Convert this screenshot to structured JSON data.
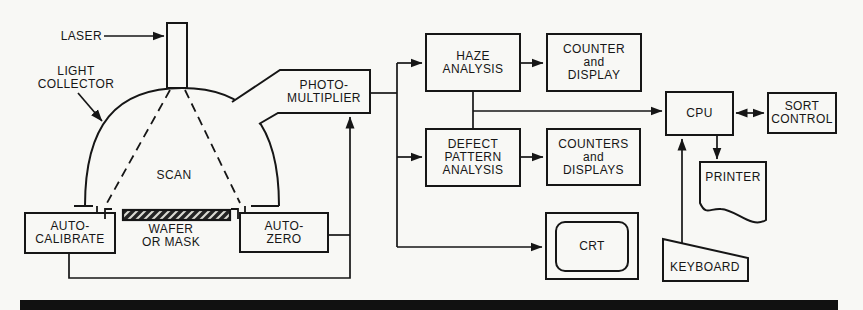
{
  "colors": {
    "ink": "#161616",
    "paper": "#f8f8f5"
  },
  "labels": {
    "laser": "LASER",
    "light_collector": "LIGHT\nCOLLECTOR",
    "scan": "SCAN",
    "wafer_or_mask": "WAFER\nOR MASK",
    "auto_calibrate": "AUTO-\nCALIBRATE",
    "auto_zero": "AUTO-\nZERO",
    "photomultiplier": "PHOTO-\nMULTIPLIER",
    "haze_analysis": "HAZE\nANALYSIS",
    "counter_and_display": "COUNTER\nand\nDISPLAY",
    "defect_pattern_analysis": "DEFECT\nPATTERN\nANALYSIS",
    "counters_and_displays": "COUNTERS\nand\nDISPLAYS",
    "cpu": "CPU",
    "sort_control": "SORT\nCONTROL",
    "crt": "CRT",
    "printer": "PRINTER",
    "keyboard": "KEYBOARD"
  }
}
